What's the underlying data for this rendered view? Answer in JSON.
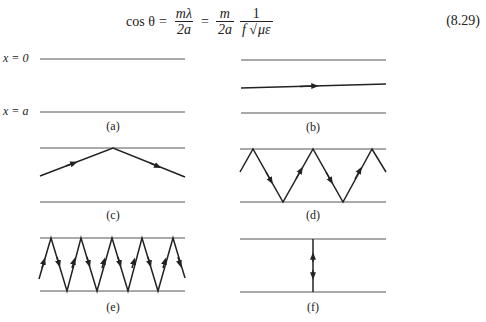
{
  "equation": {
    "lhs": "cos θ",
    "eq1": "=",
    "frac1_num": "mλ",
    "frac1_den": "2a",
    "eq2": "=",
    "frac2_num": "m",
    "frac2_den": "2a",
    "frac3_num": "1",
    "frac3_den_f": "f",
    "frac3_den_root": "√",
    "frac3_den_sqrt": "με",
    "number": "(8.29)"
  },
  "axis_labels": {
    "top": "x = 0",
    "bottom": "x = a"
  },
  "panels": [
    {
      "label": "(a)",
      "description": "two parallel plates, no ray"
    },
    {
      "label": "(b)",
      "description": "ray nearly parallel to plates"
    },
    {
      "label": "(c)",
      "description": "single reflection off top plate"
    },
    {
      "label": "(d)",
      "description": "zigzag ray with moderate angle"
    },
    {
      "label": "(e)",
      "description": "zigzag ray with steep angle"
    },
    {
      "label": "(f)",
      "description": "ray perpendicular between plates, bouncing up and down"
    }
  ],
  "colors": {
    "plate": "#555555",
    "ray": "#222222"
  }
}
